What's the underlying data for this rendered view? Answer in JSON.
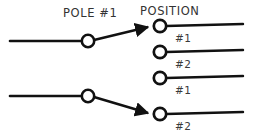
{
  "diagram": {
    "title_labels": {
      "pole": "POLE #1",
      "position": "POSITION"
    },
    "colors": {
      "background": "#ffffff",
      "wire": "#111111",
      "text": "#333333"
    },
    "poles": [
      {
        "name": "pole-1",
        "pivot": {
          "x": 88,
          "y": 41
        },
        "input_wire_start_x": 10,
        "throw_target": {
          "x": 160,
          "y": 26
        },
        "selected_position": "#1"
      },
      {
        "name": "pole-2",
        "pivot": {
          "x": 88,
          "y": 96
        },
        "input_wire_start_x": 10,
        "throw_target": {
          "x": 160,
          "y": 114
        },
        "selected_position": "#2"
      }
    ],
    "terminals": [
      {
        "id": "terminal-1",
        "label": "#1",
        "cx": 160,
        "cy": 26,
        "wire_end_x": 243,
        "connected": true
      },
      {
        "id": "terminal-2",
        "label": "#2",
        "cx": 160,
        "cy": 52,
        "wire_end_x": 243,
        "connected": false
      },
      {
        "id": "terminal-3",
        "label": "#1",
        "cx": 160,
        "cy": 78,
        "wire_end_x": 243,
        "connected": false
      },
      {
        "id": "terminal-4",
        "label": "#2",
        "cx": 160,
        "cy": 114,
        "wire_end_x": 243,
        "connected": true
      }
    ],
    "terminal_labels": [
      {
        "text": "#1",
        "x": 175,
        "y": 42
      },
      {
        "text": "#2",
        "x": 175,
        "y": 68
      },
      {
        "text": "#1",
        "x": 175,
        "y": 94
      },
      {
        "text": "#2",
        "x": 175,
        "y": 130
      }
    ],
    "header_positions": {
      "pole": {
        "x": 63,
        "y": 17
      },
      "position": {
        "x": 140,
        "y": 15
      }
    }
  }
}
